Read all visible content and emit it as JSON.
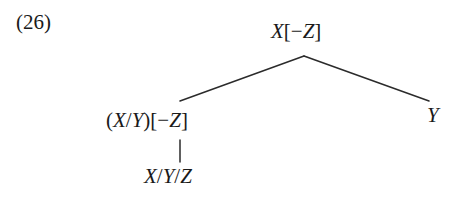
{
  "figure": {
    "example_number": "(26)",
    "type": "syntax-tree",
    "ink_color": "#2b2b2b",
    "background_color": "#ffffff"
  },
  "tree": {
    "root": {
      "label": "X[−Z]",
      "parts": {
        "category": "X",
        "open_bracket": "[",
        "minus": "−",
        "feature": "Z",
        "close_bracket": "]"
      }
    },
    "left_daughter": {
      "label": "(X/Y)[−Z]",
      "parts": {
        "open_paren": "(",
        "numerator": "X",
        "slash": "/",
        "denominator": "Y",
        "close_paren": ")",
        "open_bracket": "[",
        "minus": "−",
        "feature": "Z",
        "close_bracket": "]"
      }
    },
    "right_daughter": {
      "label": "Y",
      "parts": {
        "category": "Y"
      }
    },
    "terminal": {
      "label": "X/Y/Z",
      "parts": {
        "first": "X",
        "slash1": "/",
        "second": "Y",
        "slash2": "/",
        "third": "Z"
      }
    }
  }
}
